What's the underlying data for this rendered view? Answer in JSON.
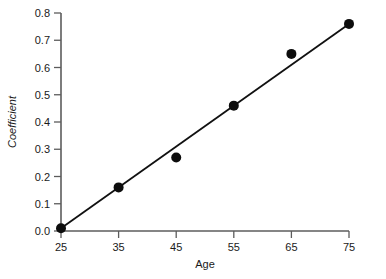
{
  "chart_data": {
    "type": "scatter",
    "title": "",
    "xlabel": "Age",
    "ylabel": "Coefficient",
    "xlim": [
      25,
      75
    ],
    "ylim": [
      0.0,
      0.8
    ],
    "grid": false,
    "legend": "none",
    "x": [
      25,
      35,
      45,
      55,
      65,
      75
    ],
    "values": [
      0.01,
      0.16,
      0.27,
      0.46,
      0.65,
      0.76
    ],
    "series": [
      {
        "name": "Coefficient",
        "x": [
          25,
          35,
          45,
          55,
          65,
          75
        ],
        "values": [
          0.01,
          0.16,
          0.27,
          0.46,
          0.65,
          0.76
        ],
        "marker": "filled-circle"
      },
      {
        "name": "fitted-line",
        "type": "line",
        "x": [
          25,
          75
        ],
        "values": [
          0.01,
          0.76
        ]
      }
    ],
    "xticks": [
      "25",
      "35",
      "45",
      "55",
      "65",
      "75"
    ],
    "xtick_values": [
      25,
      35,
      45,
      55,
      65,
      75
    ],
    "yticks": [
      "0.0",
      "0.1",
      "0.2",
      "0.3",
      "0.4",
      "0.5",
      "0.6",
      "0.7",
      "0.8"
    ],
    "ytick_values": [
      0.0,
      0.1,
      0.2,
      0.3,
      0.4,
      0.5,
      0.6,
      0.7,
      0.8
    ],
    "colors": {
      "marker": "#0d0d0d",
      "line": "#111111",
      "axis": "#5c5c5c",
      "text": "#1a1a1a",
      "background": "#ffffff"
    }
  }
}
